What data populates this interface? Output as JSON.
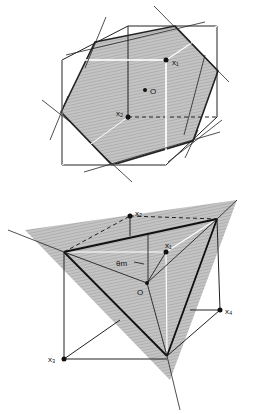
{
  "figure_top": {
    "labels": {
      "x1": "x₁",
      "x2": "x₂",
      "origin": "O"
    }
  },
  "figure_bottom": {
    "labels": {
      "x1": "x₁",
      "x2": "x₂",
      "x3": "x₃",
      "x4": "x₄",
      "origin": "O",
      "angle": "θm"
    }
  },
  "colors": {
    "shade": "#b9b9b9",
    "line": "#222222",
    "white_line": "#ffffff"
  }
}
